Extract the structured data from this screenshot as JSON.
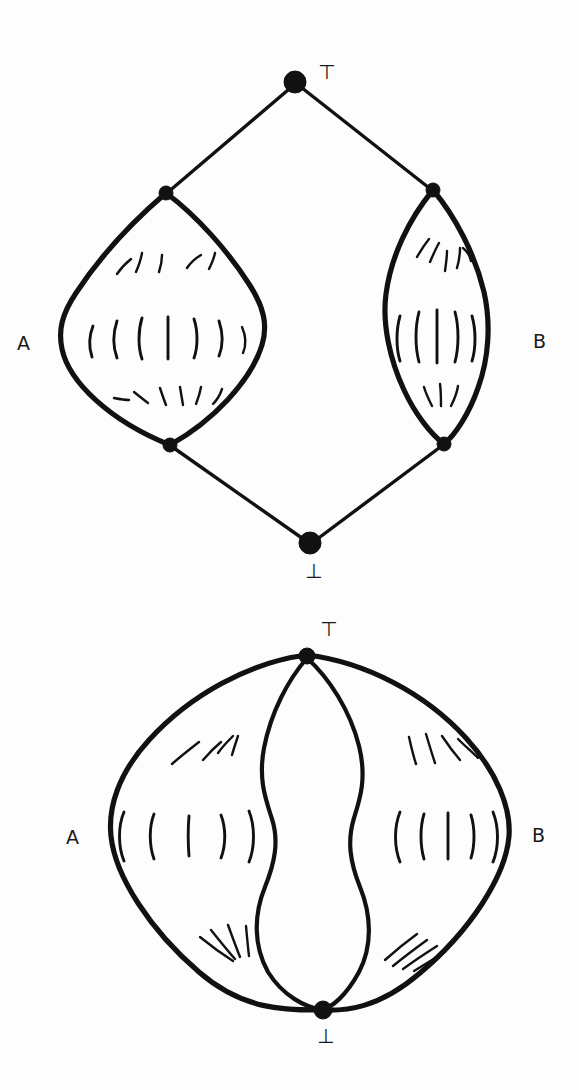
{
  "figure": {
    "background_color": "#fdfdfd",
    "ink_color": "#111111",
    "panels": [
      {
        "id": "top-panel",
        "name": "diamond-lattice-with-two-lens-regions",
        "description": "Diamond lattice with top node, bottom node, and two intermediate node pairs joined by filled lens regions labelled A and B",
        "labels": {
          "top": "⊤",
          "bottom": "⊥",
          "left_region": "A",
          "right_region": "B"
        },
        "nodes": [
          {
            "name": "top-node",
            "symbol": "⊤",
            "x": 295,
            "y": 82,
            "r": 11
          },
          {
            "name": "left-upper-node",
            "symbol": "",
            "x": 166,
            "y": 193,
            "r": 7
          },
          {
            "name": "right-upper-node",
            "symbol": "",
            "x": 433,
            "y": 190,
            "r": 7
          },
          {
            "name": "left-lower-node",
            "symbol": "",
            "x": 170,
            "y": 445,
            "r": 7
          },
          {
            "name": "right-lower-node",
            "symbol": "",
            "x": 444,
            "y": 444,
            "r": 7
          },
          {
            "name": "bottom-node",
            "symbol": "⊥",
            "x": 310,
            "y": 543,
            "r": 11
          }
        ],
        "edges": [
          {
            "name": "edge-top-to-left-upper",
            "from": "top-node",
            "to": "left-upper-node"
          },
          {
            "name": "edge-top-to-right-upper",
            "from": "top-node",
            "to": "right-upper-node"
          },
          {
            "name": "edge-left-lower-to-bottom",
            "from": "left-lower-node",
            "to": "bottom-node"
          },
          {
            "name": "edge-right-lower-to-bottom",
            "from": "right-lower-node",
            "to": "bottom-node"
          }
        ],
        "regions": [
          {
            "name": "region-a",
            "label": "A",
            "label_x": 24,
            "label_y": 344,
            "hatch_rows": 3
          },
          {
            "name": "region-b",
            "label": "B",
            "label_x": 540,
            "label_y": 342,
            "hatch_rows": 3
          }
        ]
      },
      {
        "id": "bottom-panel",
        "name": "lens-bundle-with-three-regions",
        "description": "Top and bottom nodes joined by four curves forming three regions; outer left region labelled A and outer right region labelled B, middle region unlabelled",
        "labels": {
          "top": "⊤",
          "bottom": "⊥",
          "left_region": "A",
          "right_region": "B"
        },
        "nodes": [
          {
            "name": "top-node",
            "symbol": "⊤",
            "x": 307,
            "y": 655,
            "r": 8
          },
          {
            "name": "bottom-node",
            "symbol": "⊥",
            "x": 323,
            "y": 1010,
            "r": 9
          }
        ],
        "regions": [
          {
            "name": "region-a",
            "label": "A",
            "label_x": 72,
            "label_y": 838,
            "hatch_rows": 3
          },
          {
            "name": "region-middle",
            "label": "",
            "label_x": 0,
            "label_y": 0,
            "hatch_rows": 0
          },
          {
            "name": "region-b",
            "label": "B",
            "label_x": 538,
            "label_y": 836,
            "hatch_rows": 3
          }
        ]
      }
    ]
  }
}
